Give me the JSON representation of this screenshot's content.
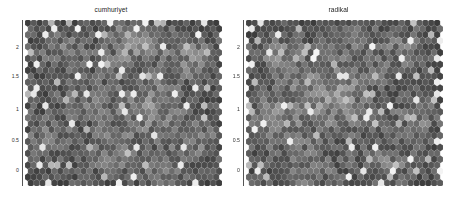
{
  "figure": {
    "background": "#ffffff",
    "width": 456,
    "height": 201
  },
  "chart_data": [
    {
      "type": "heatmap",
      "subtype": "hexbin-som",
      "title": "cumhuriyet",
      "xlabel": "",
      "ylabel": "",
      "grid": false,
      "legend": null,
      "colormap": "gray",
      "ylim": [
        -0.12,
        2.28
      ],
      "yticks": [
        0,
        0.5,
        1,
        1.5,
        2
      ],
      "ytick_labels": [
        "0",
        "0.5",
        "1",
        "1.5",
        "2"
      ],
      "xlim": [
        0,
        2.95
      ],
      "xticks": [],
      "xtick_labels": [],
      "hex_cols": 33,
      "hex_rows": 28,
      "value_range": [
        0.0,
        1.0
      ],
      "mean_value": 0.27,
      "seed": 1771,
      "blob_centers": [
        {
          "cx": 0.18,
          "cy": 0.18,
          "r": 0.16,
          "amp": 0.42
        },
        {
          "cx": 0.55,
          "cy": 0.13,
          "r": 0.2,
          "amp": 0.55
        },
        {
          "cx": 0.84,
          "cy": 0.22,
          "r": 0.17,
          "amp": 0.48
        },
        {
          "cx": 0.3,
          "cy": 0.46,
          "r": 0.18,
          "amp": 0.3
        },
        {
          "cx": 0.62,
          "cy": 0.52,
          "r": 0.22,
          "amp": 0.52
        },
        {
          "cx": 0.12,
          "cy": 0.7,
          "r": 0.16,
          "amp": 0.38
        },
        {
          "cx": 0.45,
          "cy": 0.8,
          "r": 0.19,
          "amp": 0.4
        },
        {
          "cx": 0.86,
          "cy": 0.72,
          "r": 0.17,
          "amp": 0.45
        },
        {
          "cx": 0.7,
          "cy": 0.95,
          "r": 0.15,
          "amp": 0.35
        }
      ]
    },
    {
      "type": "heatmap",
      "subtype": "hexbin-som",
      "title": "radikal",
      "xlabel": "",
      "ylabel": "",
      "grid": false,
      "legend": null,
      "colormap": "gray",
      "ylim": [
        -0.12,
        2.28
      ],
      "yticks": [
        0,
        0.5,
        1,
        1.5,
        2
      ],
      "ytick_labels": [
        "0",
        "0.5",
        "1",
        "1.5",
        "2"
      ],
      "xlim": [
        0,
        2.95
      ],
      "xticks": [],
      "xtick_labels": [],
      "hex_cols": 33,
      "hex_rows": 28,
      "value_range": [
        0.0,
        1.0
      ],
      "mean_value": 0.3,
      "seed": 4409,
      "blob_centers": [
        {
          "cx": 0.42,
          "cy": 0.46,
          "r": 0.3,
          "amp": 0.62
        },
        {
          "cx": 0.16,
          "cy": 0.2,
          "r": 0.15,
          "amp": 0.4
        },
        {
          "cx": 0.8,
          "cy": 0.18,
          "r": 0.16,
          "amp": 0.38
        },
        {
          "cx": 0.12,
          "cy": 0.62,
          "r": 0.17,
          "amp": 0.5
        },
        {
          "cx": 0.88,
          "cy": 0.58,
          "r": 0.15,
          "amp": 0.42
        },
        {
          "cx": 0.3,
          "cy": 0.92,
          "r": 0.18,
          "amp": 0.44
        },
        {
          "cx": 0.72,
          "cy": 0.88,
          "r": 0.18,
          "amp": 0.4
        },
        {
          "cx": 0.55,
          "cy": 0.12,
          "r": 0.14,
          "amp": 0.3
        }
      ]
    }
  ],
  "panels": [
    {
      "id": "cumhuriyet",
      "title": "cumhuriyet",
      "left": 0,
      "plot": {
        "x": 25,
        "y": 20,
        "w": 197,
        "h": 165
      },
      "axis": {
        "x": 22,
        "y_top": 20,
        "y_bottom": 186,
        "color": "#555555"
      },
      "ticks": [
        {
          "label": "2",
          "y": 48
        },
        {
          "label": "1.5",
          "y": 77
        },
        {
          "label": "1",
          "y": 110
        },
        {
          "label": "0.5",
          "y": 141
        },
        {
          "label": "0",
          "y": 171
        }
      ]
    },
    {
      "id": "radikal",
      "title": "radikal",
      "left": 221,
      "plot": {
        "x": 25,
        "y": 20,
        "w": 197,
        "h": 165
      },
      "axis": {
        "x": 22,
        "y_top": 20,
        "y_bottom": 186,
        "color": "#555555"
      },
      "ticks": [
        {
          "label": "2",
          "y": 48
        },
        {
          "label": "1.5",
          "y": 77
        },
        {
          "label": "1",
          "y": 110
        },
        {
          "label": "0.5",
          "y": 141
        },
        {
          "label": "0",
          "y": 171
        }
      ]
    }
  ]
}
